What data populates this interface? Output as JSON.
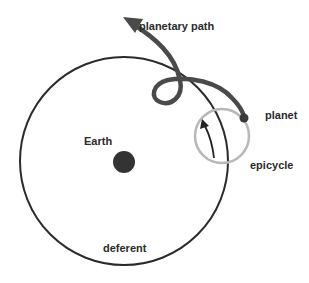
{
  "diagram": {
    "labels": {
      "planetary_path": "planetary path",
      "planet": "planet",
      "earth": "Earth",
      "epicycle": "epicycle",
      "deferent": "deferent"
    },
    "colors": {
      "background": "#ffffff",
      "deferent_stroke": "#2b2b2b",
      "path_stroke": "#4a4a4a",
      "epicycle_stroke": "#b8b8b8",
      "earth_fill": "#333333",
      "text": "#2b2b2b"
    },
    "nodes": [
      {
        "id": "earth",
        "label": "Earth",
        "shape": "filled-circle"
      },
      {
        "id": "deferent",
        "label": "deferent",
        "shape": "circle"
      },
      {
        "id": "epicycle",
        "label": "epicycle",
        "shape": "circle"
      },
      {
        "id": "planet",
        "label": "planet",
        "shape": "dot"
      },
      {
        "id": "planetary_path",
        "label": "planetary path",
        "shape": "looped-arrow"
      }
    ]
  }
}
